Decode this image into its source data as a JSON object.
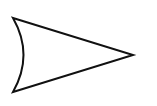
{
  "diagram": {
    "shape": "arrowhead-with-concave-back",
    "stroke_color": "#111111",
    "fill_color": "#ffffff",
    "background": "#ffffff",
    "stroke_width": 2,
    "points": {
      "top_left": [
        13,
        18
      ],
      "tip": [
        133,
        55
      ],
      "bottom_left": [
        13,
        92
      ],
      "back_curve_control": [
        34,
        55
      ]
    }
  }
}
